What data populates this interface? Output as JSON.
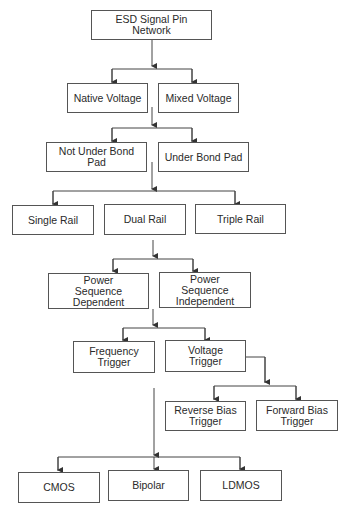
{
  "diagram": {
    "type": "hierarchy-flowchart",
    "nodes": {
      "root": "ESD Signal Pin Network",
      "native_voltage": "Native Voltage",
      "mixed_voltage": "Mixed Voltage",
      "not_under_bond_pad": "Not Under Bond Pad",
      "under_bond_pad": "Under Bond Pad",
      "single_rail": "Single Rail",
      "dual_rail": "Dual Rail",
      "triple_rail": "Triple Rail",
      "power_seq_dependent": "Power Sequence Dependent",
      "power_seq_independent": "Power Sequence Independent",
      "frequency_trigger": "Frequency Trigger",
      "voltage_trigger": "Voltage Trigger",
      "reverse_bias_trigger": "Reverse Bias Trigger",
      "forward_bias_trigger": "Forward Bias Trigger",
      "cmos": "CMOS",
      "bipolar": "Bipolar",
      "ldmos": "LDMOS"
    },
    "levels": [
      [
        "ESD Signal Pin Network"
      ],
      [
        "Native Voltage",
        "Mixed Voltage"
      ],
      [
        "Not Under Bond Pad",
        "Under Bond Pad"
      ],
      [
        "Single Rail",
        "Dual Rail",
        "Triple Rail"
      ],
      [
        "Power Sequence Dependent",
        "Power Sequence Independent"
      ],
      [
        "Frequency Trigger",
        "Voltage Trigger"
      ],
      [
        "Reverse Bias Trigger",
        "Forward Bias Trigger"
      ],
      [
        "CMOS",
        "Bipolar",
        "LDMOS"
      ]
    ],
    "colors": {
      "line": "#444444",
      "border": "#555555",
      "text": "#2a2a2a",
      "background": "#ffffff"
    }
  }
}
